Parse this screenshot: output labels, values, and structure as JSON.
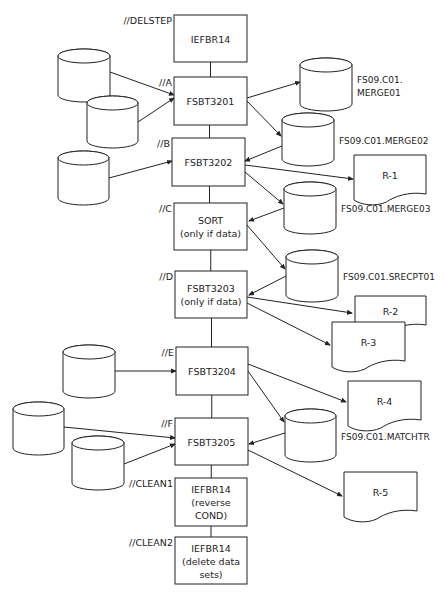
{
  "diagram": {
    "steps": [
      {
        "id": "delstep",
        "step_name": "//DELSTEP",
        "lines": [
          "IEFBR14"
        ],
        "x": 174,
        "y": 15,
        "w": 73,
        "h": 47
      },
      {
        "id": "a",
        "step_name": "//A",
        "lines": [
          "FSBT3201"
        ],
        "x": 174,
        "y": 77,
        "w": 73,
        "h": 48
      },
      {
        "id": "b",
        "step_name": "//B",
        "lines": [
          "FSBT3202"
        ],
        "x": 172,
        "y": 138,
        "w": 73,
        "h": 48
      },
      {
        "id": "c",
        "step_name": "//C",
        "lines": [
          "SORT",
          "(only if data)"
        ],
        "x": 174,
        "y": 203,
        "w": 73,
        "h": 47
      },
      {
        "id": "d",
        "step_name": "//D",
        "lines": [
          "FSBT3203",
          "(only if data)"
        ],
        "x": 175,
        "y": 271,
        "w": 72,
        "h": 47
      },
      {
        "id": "e",
        "step_name": "//E",
        "lines": [
          "FSBT3204"
        ],
        "x": 176,
        "y": 347,
        "w": 72,
        "h": 48
      },
      {
        "id": "f",
        "step_name": "//F",
        "lines": [
          "FSBT3205"
        ],
        "x": 175,
        "y": 418,
        "w": 73,
        "h": 47
      },
      {
        "id": "clean1",
        "step_name": "//CLEAN1",
        "lines": [
          "IEFBR14",
          "(reverse",
          "COND)"
        ],
        "x": 175,
        "y": 478,
        "w": 72,
        "h": 48
      },
      {
        "id": "clean2",
        "step_name": "//CLEAN2",
        "lines": [
          "IEFBR14",
          "(delete data",
          "sets)"
        ],
        "x": 175,
        "y": 537,
        "w": 72,
        "h": 47
      }
    ],
    "datasets": [
      {
        "id": "in1",
        "label": "",
        "x": 58,
        "y": 49,
        "w": 52,
        "h": 53
      },
      {
        "id": "in2",
        "label": "",
        "x": 87,
        "y": 96,
        "w": 51,
        "h": 52
      },
      {
        "id": "in3",
        "label": "",
        "x": 58,
        "y": 151,
        "w": 51,
        "h": 54
      },
      {
        "id": "merge01",
        "label": [
          "FS09.C01.",
          "MERGE01"
        ],
        "x": 300,
        "y": 58,
        "w": 52,
        "h": 53
      },
      {
        "id": "merge02",
        "label": [
          "FS09.C01.MERGE02"
        ],
        "x": 282,
        "y": 113,
        "w": 52,
        "h": 53
      },
      {
        "id": "merge03",
        "label": [
          "FS09.C01.MERGE03"
        ],
        "x": 284,
        "y": 182,
        "w": 52,
        "h": 52
      },
      {
        "id": "srecpt01",
        "label": [
          "FS09.C01.SRECPT01"
        ],
        "x": 286,
        "y": 250,
        "w": 52,
        "h": 52
      },
      {
        "id": "in4",
        "label": "",
        "x": 63,
        "y": 345,
        "w": 52,
        "h": 53
      },
      {
        "id": "in5",
        "label": "",
        "x": 13,
        "y": 402,
        "w": 51,
        "h": 53
      },
      {
        "id": "in6",
        "label": "",
        "x": 72,
        "y": 436,
        "w": 52,
        "h": 54
      },
      {
        "id": "matchtr",
        "label": [
          "FS09.C01.MATCHTR"
        ],
        "x": 285,
        "y": 409,
        "w": 51,
        "h": 53
      }
    ],
    "reports": [
      {
        "id": "r1",
        "label": "R-1",
        "x": 354,
        "y": 155,
        "w": 72,
        "h": 50
      },
      {
        "id": "r2",
        "label": "R-2",
        "x": 355,
        "y": 296,
        "w": 71,
        "h": 40
      },
      {
        "id": "r3",
        "label": "R-3",
        "x": 332,
        "y": 322,
        "w": 73,
        "h": 50
      },
      {
        "id": "r4",
        "label": "R-4",
        "x": 348,
        "y": 381,
        "w": 73,
        "h": 50
      },
      {
        "id": "r5",
        "label": "R-5",
        "x": 344,
        "y": 472,
        "w": 73,
        "h": 50
      }
    ],
    "connectors": [
      {
        "from": "delstep",
        "to": "a"
      },
      {
        "from": "a",
        "to": "b"
      },
      {
        "from": "b",
        "to": "c"
      },
      {
        "from": "c",
        "to": "d"
      },
      {
        "from": "d",
        "to": "e"
      },
      {
        "from": "e",
        "to": "f"
      },
      {
        "from": "f",
        "to": "clean1"
      },
      {
        "from": "clean1",
        "to": "clean2"
      }
    ],
    "arrows": [
      {
        "x1": 110,
        "y1": 72,
        "x2": 174,
        "y2": 95
      },
      {
        "x1": 138,
        "y1": 122,
        "x2": 174,
        "y2": 98
      },
      {
        "x1": 247,
        "y1": 98,
        "x2": 300,
        "y2": 82
      },
      {
        "x1": 247,
        "y1": 101,
        "x2": 281,
        "y2": 136
      },
      {
        "x1": 282,
        "y1": 146,
        "x2": 245,
        "y2": 161
      },
      {
        "x1": 109,
        "y1": 178,
        "x2": 172,
        "y2": 161
      },
      {
        "x1": 245,
        "y1": 165,
        "x2": 353,
        "y2": 179
      },
      {
        "x1": 245,
        "y1": 172,
        "x2": 283,
        "y2": 204
      },
      {
        "x1": 284,
        "y1": 208,
        "x2": 249,
        "y2": 221
      },
      {
        "x1": 247,
        "y1": 225,
        "x2": 285,
        "y2": 269
      },
      {
        "x1": 286,
        "y1": 276,
        "x2": 249,
        "y2": 295
      },
      {
        "x1": 247,
        "y1": 297,
        "x2": 352,
        "y2": 313
      },
      {
        "x1": 247,
        "y1": 303,
        "x2": 330,
        "y2": 345
      },
      {
        "x1": 115,
        "y1": 371,
        "x2": 176,
        "y2": 371
      },
      {
        "x1": 248,
        "y1": 364,
        "x2": 346,
        "y2": 402
      },
      {
        "x1": 248,
        "y1": 371,
        "x2": 284,
        "y2": 422
      },
      {
        "x1": 64,
        "y1": 427,
        "x2": 175,
        "y2": 438
      },
      {
        "x1": 124,
        "y1": 464,
        "x2": 175,
        "y2": 444
      },
      {
        "x1": 285,
        "y1": 433,
        "x2": 249,
        "y2": 444
      },
      {
        "x1": 248,
        "y1": 450,
        "x2": 342,
        "y2": 496
      }
    ]
  }
}
